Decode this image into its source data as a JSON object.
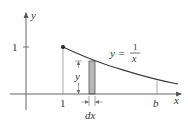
{
  "diagram": {
    "type": "area-under-curve",
    "colors": {
      "axis": "#555555",
      "curve": "#3a3a3a",
      "shade_fill": "#b8b8b8",
      "shade_stroke": "#555555",
      "thin_line": "#888888",
      "text": "#333333"
    },
    "axes": {
      "x_label": "x",
      "y_label": "y"
    },
    "ticks": {
      "y_one": "1",
      "x_one": "1",
      "x_b": "b"
    },
    "curve": {
      "eq_lhs": "y =",
      "eq_num": "1",
      "eq_den": "x"
    },
    "annotations": {
      "height_label": "y",
      "width_label": "dx"
    }
  }
}
